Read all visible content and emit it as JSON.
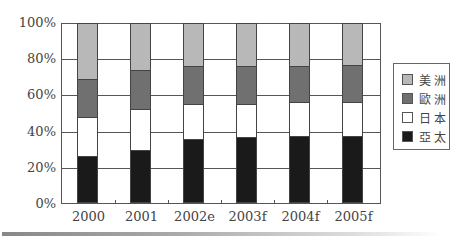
{
  "chart_data": {
    "type": "bar",
    "stacked": true,
    "percent": true,
    "title": "",
    "xlabel": "",
    "ylabel": "",
    "ylim": [
      0,
      100
    ],
    "yticks": [
      "0%",
      "20%",
      "40%",
      "60%",
      "80%",
      "100%"
    ],
    "categories": [
      "2000",
      "2001",
      "2002e",
      "2003f",
      "2004f",
      "2005f"
    ],
    "series": [
      {
        "name": "亞太",
        "color": "#1a1a1a",
        "values": [
          25.5,
          29,
          35,
          36.5,
          37,
          37
        ]
      },
      {
        "name": "日本",
        "color": "#ffffff",
        "values": [
          22,
          23,
          20,
          18.5,
          19,
          19
        ]
      },
      {
        "name": "歐洲",
        "color": "#707070",
        "values": [
          21.5,
          22,
          21,
          21,
          20,
          20.5
        ]
      },
      {
        "name": "美洲",
        "color": "#b8b8b8",
        "values": [
          31,
          26,
          24,
          24,
          24,
          23.5
        ]
      }
    ],
    "grid": true,
    "legend_position": "right",
    "legend_order": [
      "美洲",
      "歐洲",
      "日本",
      "亞太"
    ]
  }
}
